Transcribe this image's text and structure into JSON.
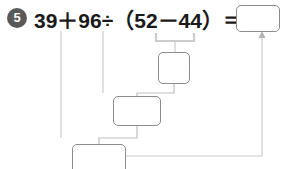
{
  "problem": {
    "number": "5",
    "expression_parts": {
      "a": "39",
      "plus": "＋",
      "b": "96",
      "divide": "÷",
      "lparen": "（",
      "c": "52",
      "minus": "－",
      "d": "44",
      "rparen": "）",
      "equals": "＝"
    },
    "expression_full": "39＋96÷（52－44）＝"
  },
  "boxes": {
    "answer": "",
    "step1": "",
    "step2": "",
    "step3": ""
  },
  "colors": {
    "badge_fill": "#595959",
    "badge_text": "#ffffff",
    "expression_text": "#1a1a1a",
    "box_border": "#8c8c8c",
    "wire": "#b3b3b3",
    "bracket": "#cccccc",
    "background": "#ffffff"
  }
}
